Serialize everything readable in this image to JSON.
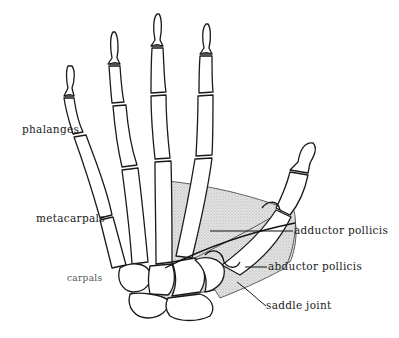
{
  "figure": {
    "labels": {
      "phalanges": "phalanges",
      "metacarpals": "metacarpals",
      "carpals": "carpals",
      "adductor_pollicis": "adductor pollicis",
      "abductor_pollicis": "abductor pollicis",
      "saddle_joint": "saddle joint"
    },
    "colors": {
      "line": "#1a1a1a",
      "muscle_fill": "#d9d9d9",
      "background": "#ffffff"
    }
  }
}
